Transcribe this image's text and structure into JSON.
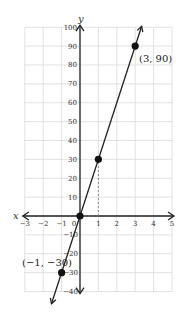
{
  "chart_data": {
    "type": "line",
    "title": "",
    "xlabel": "x",
    "ylabel": "y",
    "xlim": [
      -3,
      5
    ],
    "ylim": [
      -40,
      100
    ],
    "grid": true,
    "x_ticks": [
      -3,
      -2,
      -1,
      0,
      1,
      2,
      3,
      4,
      5
    ],
    "y_ticks": [
      -40,
      -30,
      -20,
      -10,
      10,
      20,
      30,
      40,
      50,
      60,
      70,
      80,
      90,
      100
    ],
    "series": [
      {
        "name": "y = 30x",
        "x": [
          -1,
          0,
          1,
          3
        ],
        "y": [
          -30,
          0,
          30,
          90
        ],
        "marked_points": [
          {
            "x": -1,
            "y": -30,
            "label": "(−1, −30)"
          },
          {
            "x": 0,
            "y": 0,
            "label": ""
          },
          {
            "x": 1,
            "y": 30,
            "label": ""
          },
          {
            "x": 3,
            "y": 90,
            "label": "(3, 90)"
          }
        ]
      }
    ],
    "annotations": [
      {
        "type": "dashed-guide",
        "from": [
          1,
          0
        ],
        "to": [
          1,
          30
        ]
      },
      {
        "type": "dashed-guide",
        "from": [
          0,
          0
        ],
        "to": [
          1,
          0
        ]
      }
    ]
  },
  "labels": {
    "x_axis": "x",
    "y_axis": "y",
    "point_top": "(3, 90)",
    "point_bottom": "(−1, −30)",
    "x_ticks": [
      "−3",
      "−2",
      "−1",
      "0",
      "1",
      "2",
      "3",
      "4",
      "5"
    ],
    "y_ticks_pos": [
      "100",
      "90",
      "80",
      "70",
      "60",
      "50",
      "40",
      "30",
      "20",
      "10"
    ],
    "y_ticks_neg": [
      "−10",
      "−20",
      "−30",
      "−40"
    ]
  },
  "colors": {
    "grid": "#d9d9d9",
    "axis": "#222222",
    "line": "#222222",
    "point": "#111111"
  }
}
